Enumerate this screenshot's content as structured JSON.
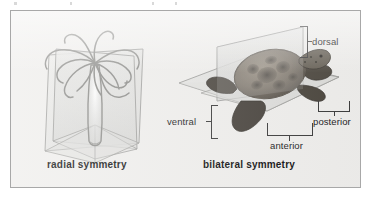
{
  "figure": {
    "background_color": "#efeeec",
    "frame_color": "#a8a8a8",
    "page_color": "#ffffff"
  },
  "panels": [
    {
      "id": "radial",
      "caption": "radial symmetry",
      "organism": "sea anemone",
      "organism_icon": "sea-anemone-icon",
      "planes": [
        {
          "name": "vertical-plane-front",
          "type": "rectangle"
        },
        {
          "name": "vertical-plane-side",
          "type": "rectangle"
        }
      ],
      "labels": []
    },
    {
      "id": "bilateral",
      "caption": "bilateral symmetry",
      "organism": "sea turtle",
      "organism_icon": "sea-turtle-icon",
      "planes": [
        {
          "name": "sagittal-plane",
          "type": "vertical"
        },
        {
          "name": "frontal-plane",
          "type": "horizontal"
        }
      ],
      "labels": [
        {
          "key": "dorsal",
          "text": "dorsal"
        },
        {
          "key": "ventral",
          "text": "ventral"
        },
        {
          "key": "anterior",
          "text": "anterior"
        },
        {
          "key": "posterior",
          "text": "posterior"
        }
      ]
    }
  ],
  "labels": {
    "dorsal": "dorsal",
    "ventral": "ventral",
    "anterior": "anterior",
    "posterior": "posterior",
    "radial_caption": "radial symmetry",
    "bilateral_caption": "bilateral symmetry"
  },
  "colors": {
    "plane_fill": "#d8d8d6",
    "plane_stroke": "#9a9a98",
    "anemone_stroke": "#8e8e8c",
    "turtle_body": "#6f6a60",
    "label_text": "#1c1c1c",
    "leader_line": "#3d3d3d"
  }
}
